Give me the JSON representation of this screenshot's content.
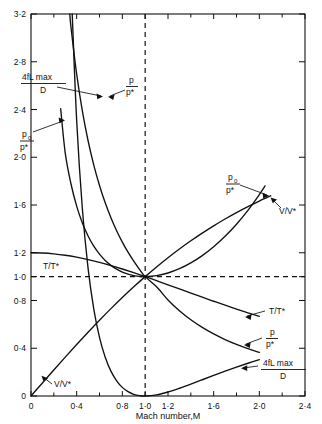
{
  "chart_data": {
    "type": "line",
    "title": "",
    "xlabel": "Mach number,M",
    "ylabel": "",
    "xlim": [
      0,
      2.4
    ],
    "ylim": [
      0,
      3.2
    ],
    "grid": false,
    "legend": "inline-annotations",
    "xticks": [
      {
        "value": 0,
        "label": "0"
      },
      {
        "value": 0.4,
        "label": "0·4"
      },
      {
        "value": 0.8,
        "label": "0·8"
      },
      {
        "value": 1.0,
        "label": "1·0"
      },
      {
        "value": 1.2,
        "label": "1·2"
      },
      {
        "value": 1.6,
        "label": "1·6"
      },
      {
        "value": 2.0,
        "label": "2·0"
      },
      {
        "value": 2.4,
        "label": "2·4"
      }
    ],
    "xticks_minor": [
      0.2,
      0.6,
      1.4,
      1.8,
      2.2
    ],
    "yticks": [
      {
        "value": 0,
        "label": "0"
      },
      {
        "value": 0.4,
        "label": "0·4"
      },
      {
        "value": 0.8,
        "label": "0·8"
      },
      {
        "value": 1.0,
        "label": "1·0"
      },
      {
        "value": 1.2,
        "label": "1·2"
      },
      {
        "value": 1.6,
        "label": "1·6"
      },
      {
        "value": 2.0,
        "label": "2·0"
      },
      {
        "value": 2.4,
        "label": "2·4"
      },
      {
        "value": 2.8,
        "label": "2·8"
      },
      {
        "value": 3.2,
        "label": "3·2"
      }
    ],
    "reference_lines": [
      {
        "orientation": "vertical",
        "value": 1.0,
        "style": "dashed"
      },
      {
        "orientation": "horizontal",
        "value": 1.0,
        "style": "dashed"
      }
    ],
    "series": [
      {
        "name": "p/p*",
        "label_main": "p",
        "label_den": "p*",
        "points": [
          [
            0.2,
            5.4554
          ],
          [
            0.25,
            4.3546
          ],
          [
            0.3,
            3.6191
          ],
          [
            0.35,
            3.0922
          ],
          [
            0.4,
            2.6958
          ],
          [
            0.45,
            2.3865
          ],
          [
            0.5,
            2.1381
          ],
          [
            0.55,
            1.9341
          ],
          [
            0.6,
            1.7634
          ],
          [
            0.65,
            1.6183
          ],
          [
            0.7,
            1.4934
          ],
          [
            0.75,
            1.3848
          ],
          [
            0.8,
            1.2893
          ],
          [
            0.85,
            1.2047
          ],
          [
            0.9,
            1.1291
          ],
          [
            0.95,
            1.0613
          ],
          [
            1.0,
            1.0
          ],
          [
            1.1,
            0.9146
          ],
          [
            1.2,
            0.8044
          ],
          [
            1.3,
            0.7138
          ],
          [
            1.4,
            0.6383
          ],
          [
            1.5,
            0.5745
          ],
          [
            1.6,
            0.52
          ],
          [
            1.7,
            0.473
          ],
          [
            1.8,
            0.4322
          ],
          [
            1.9,
            0.3964
          ],
          [
            2.0,
            0.3651
          ]
        ]
      },
      {
        "name": "p0/p*",
        "label_main": "p",
        "label_sub": "0",
        "label_den": "p*",
        "points": [
          [
            0.26,
            2.4065
          ],
          [
            0.3,
            2.0351
          ],
          [
            0.35,
            1.778
          ],
          [
            0.4,
            1.5901
          ],
          [
            0.45,
            1.4487
          ],
          [
            0.5,
            1.3398
          ],
          [
            0.55,
            1.255
          ],
          [
            0.6,
            1.1882
          ],
          [
            0.65,
            1.1356
          ],
          [
            0.7,
            1.0944
          ],
          [
            0.75,
            1.0624
          ],
          [
            0.8,
            1.0382
          ],
          [
            0.85,
            1.0207
          ],
          [
            0.9,
            1.0089
          ],
          [
            0.95,
            1.0021
          ],
          [
            1.0,
            1.0
          ],
          [
            1.1,
            1.0079
          ],
          [
            1.2,
            1.0304
          ],
          [
            1.3,
            1.0663
          ],
          [
            1.4,
            1.1149
          ],
          [
            1.5,
            1.1762
          ],
          [
            1.6,
            1.2502
          ],
          [
            1.7,
            1.3376
          ],
          [
            1.8,
            1.439
          ],
          [
            1.9,
            1.5553
          ],
          [
            2.0,
            1.6875
          ],
          [
            2.05,
            1.76
          ]
        ]
      },
      {
        "name": "T/T*",
        "label": "T/T*",
        "points": [
          [
            0.0,
            1.2
          ],
          [
            0.1,
            1.1976
          ],
          [
            0.2,
            1.1905
          ],
          [
            0.3,
            1.1788
          ],
          [
            0.4,
            1.1628
          ],
          [
            0.5,
            1.1429
          ],
          [
            0.6,
            1.1194
          ],
          [
            0.7,
            1.0929
          ],
          [
            0.8,
            1.0638
          ],
          [
            0.9,
            1.0327
          ],
          [
            1.0,
            1.0
          ],
          [
            1.1,
            0.9662
          ],
          [
            1.2,
            0.9317
          ],
          [
            1.3,
            0.8969
          ],
          [
            1.4,
            0.8621
          ],
          [
            1.5,
            0.8276
          ],
          [
            1.6,
            0.7937
          ],
          [
            1.7,
            0.7605
          ],
          [
            1.8,
            0.7282
          ],
          [
            1.9,
            0.6969
          ],
          [
            2.0,
            0.6667
          ]
        ]
      },
      {
        "name": "V/V*",
        "label": "V/V*",
        "points": [
          [
            0.0,
            0.0
          ],
          [
            0.1,
            0.1094
          ],
          [
            0.2,
            0.2182
          ],
          [
            0.3,
            0.3257
          ],
          [
            0.4,
            0.4313
          ],
          [
            0.5,
            0.5345
          ],
          [
            0.6,
            0.6348
          ],
          [
            0.7,
            0.7318
          ],
          [
            0.8,
            0.8251
          ],
          [
            0.9,
            0.9146
          ],
          [
            1.0,
            1.0
          ],
          [
            1.1,
            1.0812
          ],
          [
            1.2,
            1.1583
          ],
          [
            1.3,
            1.2311
          ],
          [
            1.4,
            1.2999
          ],
          [
            1.5,
            1.3646
          ],
          [
            1.6,
            1.4254
          ],
          [
            1.7,
            1.4825
          ],
          [
            1.8,
            1.536
          ],
          [
            1.9,
            1.5861
          ],
          [
            2.0,
            1.633
          ],
          [
            2.1,
            1.6769
          ]
        ]
      },
      {
        "name": "4fLmax/D",
        "label_main": "4fL max",
        "label_den": "D",
        "points": [
          [
            0.26,
            6.3
          ],
          [
            0.3,
            5.2993
          ],
          [
            0.35,
            3.4525
          ],
          [
            0.4,
            2.3085
          ],
          [
            0.45,
            1.5664
          ],
          [
            0.5,
            1.0691
          ],
          [
            0.55,
            0.7281
          ],
          [
            0.6,
            0.4908
          ],
          [
            0.65,
            0.3246
          ],
          [
            0.7,
            0.2081
          ],
          [
            0.75,
            0.1273
          ],
          [
            0.8,
            0.0723
          ],
          [
            0.85,
            0.0363
          ],
          [
            0.9,
            0.0145
          ],
          [
            0.95,
            0.0033
          ],
          [
            1.0,
            0.0
          ],
          [
            1.1,
            0.0099
          ],
          [
            1.2,
            0.0336
          ],
          [
            1.3,
            0.0648
          ],
          [
            1.4,
            0.0997
          ],
          [
            1.5,
            0.1361
          ],
          [
            1.6,
            0.1724
          ],
          [
            1.7,
            0.2078
          ],
          [
            1.8,
            0.2419
          ],
          [
            1.9,
            0.2743
          ],
          [
            2.0,
            0.305
          ]
        ]
      }
    ]
  },
  "annotations": {
    "fanno_top_left": {
      "num": "4fL max",
      "den": "D"
    },
    "p_over_pstar_top": {
      "num": "p",
      "den": "p*"
    },
    "p0_over_pstar_left": {
      "num": "p",
      "sub": "0",
      "den": "p*"
    },
    "p0_over_pstar_right": {
      "num": "p",
      "sub": "0",
      "den": "p*"
    },
    "v_over_vstar_right": {
      "text": "V/V*"
    },
    "v_over_vstar_left": {
      "text": "V/V*"
    },
    "t_over_tstar_left": {
      "text": "T/T*"
    },
    "t_over_tstar_right": {
      "text": "T/T*"
    },
    "p_over_pstar_right": {
      "num": "p",
      "den": "p*"
    },
    "fanno_bottom_right": {
      "num": "4fL max",
      "den": "D"
    }
  },
  "axis": {
    "xlabel": "Mach number,M"
  }
}
